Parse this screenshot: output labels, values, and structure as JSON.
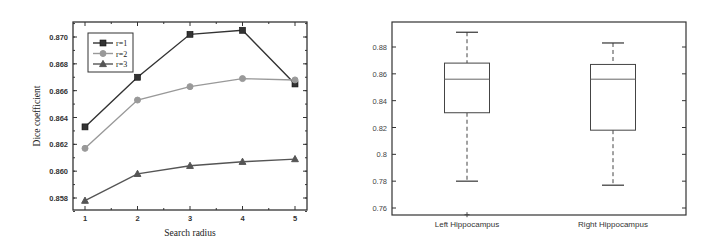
{
  "chart_data": [
    {
      "type": "line",
      "title": "",
      "xlabel": "Search radius",
      "ylabel": "Dice coefficient",
      "x": [
        1,
        2,
        3,
        4,
        5
      ],
      "xticks": [
        "1",
        "2",
        "3",
        "4",
        "5"
      ],
      "yticks": [
        "0.858",
        "0.860",
        "0.862",
        "0.864",
        "0.866",
        "0.868",
        "0.870"
      ],
      "ylim": [
        0.857,
        0.8713
      ],
      "legend_position": "upper left",
      "series": [
        {
          "name": "r=1",
          "marker": "square",
          "color": "#333333",
          "values": [
            0.8633,
            0.867,
            0.8702,
            0.8705,
            0.8665
          ]
        },
        {
          "name": "r=2",
          "marker": "circle",
          "color": "#999999",
          "values": [
            0.8617,
            0.8653,
            0.8663,
            0.8669,
            0.8668
          ]
        },
        {
          "name": "r=3",
          "marker": "triangle",
          "color": "#555555",
          "values": [
            0.8578,
            0.8598,
            0.8604,
            0.8607,
            0.8609
          ]
        }
      ]
    },
    {
      "type": "box",
      "title": "",
      "xlabel": "",
      "ylabel": "",
      "categories": [
        "Left Hippocampus",
        "Right Hippocampus"
      ],
      "yticks": [
        "0.76",
        "0.78",
        "0.8",
        "0.82",
        "0.84",
        "0.86",
        "0.88"
      ],
      "ylim": [
        0.749,
        0.899
      ],
      "boxes": [
        {
          "name": "Left Hippocampus",
          "whisker_low": 0.78,
          "q1": 0.831,
          "median": 0.856,
          "q3": 0.868,
          "whisker_high": 0.891,
          "outliers": [
            0.755
          ]
        },
        {
          "name": "Right Hippocampus",
          "whisker_low": 0.777,
          "q1": 0.818,
          "median": 0.856,
          "q3": 0.867,
          "whisker_high": 0.883,
          "outliers": []
        }
      ]
    }
  ]
}
